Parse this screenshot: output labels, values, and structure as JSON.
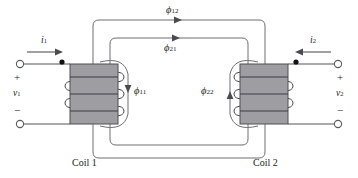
{
  "figure": {
    "background_color": "#ffffff",
    "core_color": "#9d9da2",
    "line_color": "#55555a",
    "text_color": "#1c1c20"
  },
  "labels": {
    "coil1": "Coil 1",
    "coil2": "Coil 2",
    "current1_symbol": "i",
    "current1_sub": "1",
    "current2_symbol": "i",
    "current2_sub": "2",
    "voltage1_symbol": "v",
    "voltage1_sub": "1",
    "voltage2_symbol": "v",
    "voltage2_sub": "2",
    "plus": "+",
    "minus": "−",
    "flux12_symbol": "ϕ",
    "flux12_sub": "12",
    "flux21_symbol": "ϕ",
    "flux21_sub": "21",
    "flux11_symbol": "ϕ",
    "flux11_sub": "11",
    "flux22_symbol": "ϕ",
    "flux22_sub": "22"
  },
  "diagram_data": {
    "type": "schematic",
    "description": "Two magnetically coupled coils showing mutual and leakage flux paths",
    "coils": [
      {
        "name": "Coil 1",
        "side": "left",
        "current": "i1",
        "voltage": "v1",
        "dot_position": "top-left",
        "turns_drawn": 3,
        "leakage_flux": "ϕ11",
        "leakage_flux_direction": "down"
      },
      {
        "name": "Coil 2",
        "side": "right",
        "current": "i2",
        "voltage": "v2",
        "dot_position": "top-right",
        "turns_drawn": 3,
        "leakage_flux": "ϕ22",
        "leakage_flux_direction": "up"
      }
    ],
    "mutual_fluxes": [
      {
        "name": "ϕ12",
        "label_position": "above-line",
        "direction": "left-to-right",
        "loop": "outer"
      },
      {
        "name": "ϕ21",
        "label_position": "below-line",
        "direction": "left-to-right",
        "loop": "inner"
      }
    ],
    "terminals": [
      {
        "coil": "Coil 1",
        "polarity": "+",
        "position": "upper-left"
      },
      {
        "coil": "Coil 1",
        "polarity": "−",
        "position": "lower-left"
      },
      {
        "coil": "Coil 2",
        "polarity": "+",
        "position": "upper-right"
      },
      {
        "coil": "Coil 2",
        "polarity": "−",
        "position": "lower-right"
      }
    ]
  }
}
